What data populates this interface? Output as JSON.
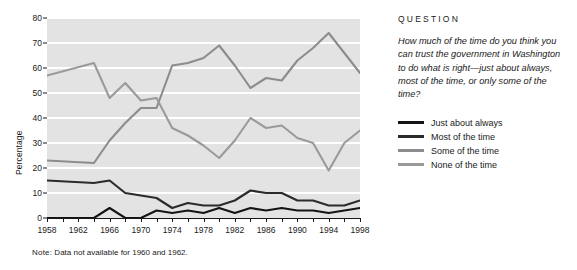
{
  "chart_data": {
    "type": "line",
    "title": "",
    "xlabel": "",
    "ylabel": "Percentage",
    "xlim": [
      1958,
      1998
    ],
    "ylim": [
      0,
      80
    ],
    "grid": true,
    "legend_position": "right",
    "note": "Data not available for 1960 and 1962.",
    "note_label": "Note:",
    "x": [
      1958,
      1964,
      1966,
      1968,
      1970,
      1972,
      1974,
      1976,
      1978,
      1980,
      1982,
      1984,
      1986,
      1988,
      1990,
      1992,
      1994,
      1996,
      1998
    ],
    "xticks": [
      1958,
      1962,
      1966,
      1970,
      1974,
      1978,
      1982,
      1986,
      1990,
      1994,
      1998
    ],
    "yticks": [
      0,
      10,
      20,
      30,
      40,
      50,
      60,
      70,
      80
    ],
    "series": [
      {
        "name": "Just about always",
        "color": "#141414",
        "values": [
          0,
          0,
          4,
          0,
          0,
          3,
          2,
          3,
          2,
          4,
          2,
          4,
          3,
          4,
          3,
          3,
          2,
          3,
          4
        ]
      },
      {
        "name": "Most of the time",
        "color": "#2b2b2b",
        "values": [
          15,
          14,
          15,
          10,
          9,
          8,
          4,
          6,
          5,
          5,
          7,
          11,
          10,
          10,
          7,
          7,
          5,
          5,
          7
        ]
      },
      {
        "name": "Some of the time",
        "color": "#8c8c8c",
        "values": [
          23,
          22,
          31,
          38,
          44,
          44,
          61,
          62,
          64,
          69,
          61,
          52,
          56,
          55,
          63,
          68,
          74,
          66,
          58
        ]
      },
      {
        "name": "None of the time",
        "color": "#9a9a9a",
        "values": [
          57,
          62,
          48,
          54,
          47,
          48,
          36,
          33,
          29,
          24,
          31,
          40,
          36,
          37,
          32,
          30,
          19,
          30,
          35
        ]
      }
    ]
  },
  "side": {
    "question_heading": "QUESTION",
    "question_text": "How much of the time do you think you can trust the government in Washington to do what is right—just about always, most of the time, or only some of the time?",
    "legend": [
      {
        "label": "Just about always",
        "color": "#141414"
      },
      {
        "label": "Most of the time",
        "color": "#2b2b2b"
      },
      {
        "label": "Some of the time",
        "color": "#8c8c8c"
      },
      {
        "label": "None of the time",
        "color": "#9a9a9a"
      }
    ]
  }
}
